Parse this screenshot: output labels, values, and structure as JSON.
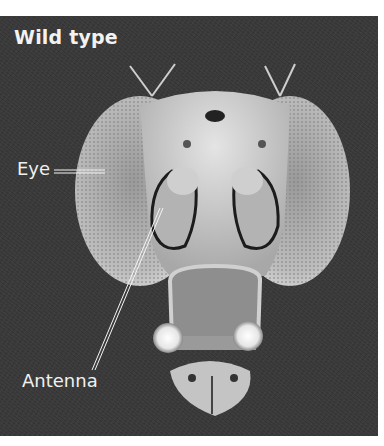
{
  "figure": {
    "title": "Wild type",
    "background_color": "#3b3b3b",
    "label_color": "#f0f0f0"
  },
  "labels": [
    {
      "id": "eye",
      "text": "Eye"
    },
    {
      "id": "antenna",
      "text": "Antenna"
    }
  ]
}
